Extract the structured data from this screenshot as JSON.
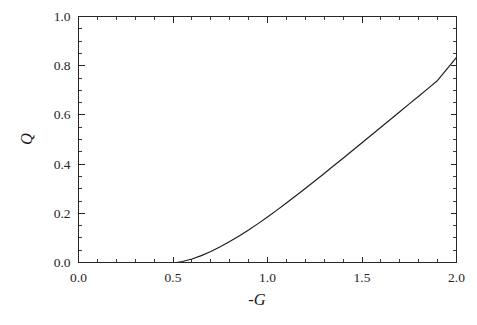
{
  "chart_data": {
    "type": "line",
    "title": "",
    "subtitle": "",
    "xlabel": "-G",
    "ylabel": "Q",
    "xlim": [
      0.0,
      2.0
    ],
    "ylim": [
      0.0,
      1.0
    ],
    "grid": false,
    "legend": null,
    "legend_position": "none",
    "background_color": "#ffffff",
    "line_color": "#1c1c1c",
    "axis_color": "#262626",
    "x_ticks": [
      0.0,
      0.5,
      1.0,
      1.5,
      2.0
    ],
    "x_ticklabels": [
      "0.0",
      "0.5",
      "1.0",
      "1.5",
      "2.0"
    ],
    "x_minor_tick_step": 0.1,
    "y_ticks": [
      0.0,
      0.2,
      0.4,
      0.6,
      0.8,
      1.0
    ],
    "y_ticklabels": [
      "0.0",
      "0.2",
      "0.4",
      "0.6",
      "0.8",
      "1.0"
    ],
    "y_minor_tick_step": 0.05,
    "tick_direction": "in",
    "series": [
      {
        "name": "Q",
        "x": [
          0.52,
          0.55,
          0.6,
          0.65,
          0.7,
          0.75,
          0.8,
          0.85,
          0.9,
          0.95,
          1.0,
          1.05,
          1.1,
          1.15,
          1.2,
          1.25,
          1.3,
          1.35,
          1.4,
          1.45,
          1.5,
          1.55,
          1.6,
          1.65,
          1.7,
          1.75,
          1.8,
          1.85,
          1.9,
          1.95,
          2.0
        ],
        "y": [
          0.0,
          0.004,
          0.014,
          0.028,
          0.045,
          0.064,
          0.085,
          0.108,
          0.132,
          0.158,
          0.185,
          0.213,
          0.242,
          0.271,
          0.301,
          0.331,
          0.362,
          0.393,
          0.424,
          0.455,
          0.487,
          0.518,
          0.55,
          0.581,
          0.613,
          0.645,
          0.676,
          0.708,
          0.74,
          0.787,
          0.834
        ]
      }
    ],
    "annotations": []
  },
  "figure": {
    "x_axis_title": "-G",
    "y_axis_title": "Q"
  }
}
